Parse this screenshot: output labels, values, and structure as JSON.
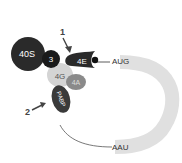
{
  "diagram": {
    "labels": {
      "ribosome": "40S",
      "eif3": "3",
      "eif4e": "4E",
      "eif4g": "4G",
      "eif4a": "4A",
      "pabp": "PABP",
      "start_codon": "AUG",
      "stop_codon": "AAU",
      "polyA": "AAAAAAAAAA",
      "arrow1": "1",
      "arrow2": "2"
    },
    "colors": {
      "dark": "#2a2a2a",
      "medium": "#8a8a8a",
      "light": "#d4d4d4",
      "mrna": "#e0e0e0"
    }
  }
}
